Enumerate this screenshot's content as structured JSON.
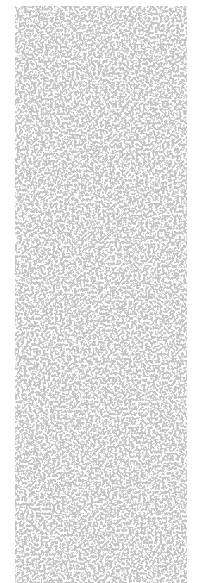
{
  "image": {
    "kind": "noise-texture",
    "description": "Gray speckled granite-like noise pattern on white background",
    "colors": {
      "background": "#ffffff",
      "speckle": "#8c8c8c"
    }
  }
}
